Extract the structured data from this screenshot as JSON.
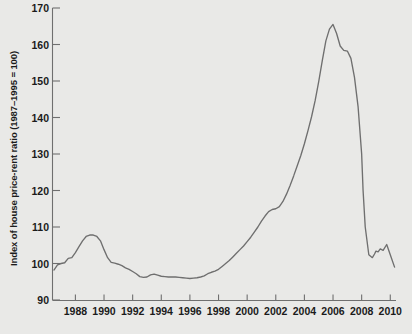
{
  "chart_data": {
    "type": "line",
    "title": "",
    "subtitle": "",
    "xlabel": "",
    "ylabel": "Index of house price-rent ratio (1987–1995 = 100)",
    "xlim": [
      1986.4,
      2010.4
    ],
    "ylim": [
      90,
      170
    ],
    "grid": false,
    "legend": null,
    "annotations": [],
    "xticks": [
      1988,
      1990,
      1992,
      1994,
      1996,
      1998,
      2000,
      2002,
      2004,
      2006,
      2008,
      2010
    ],
    "xtick_labels": [
      "1988",
      "1990",
      "1992",
      "1994",
      "1996",
      "1998",
      "2000",
      "2002",
      "2004",
      "2006",
      "2008",
      "2010"
    ],
    "yticks": [
      90,
      100,
      110,
      120,
      130,
      140,
      150,
      160,
      170
    ],
    "ytick_labels": [
      "90",
      "100",
      "110",
      "120",
      "130",
      "140",
      "150",
      "160",
      "170"
    ],
    "series": [
      {
        "name": "House price-rent ratio index",
        "color": "#6f6f6f",
        "x": [
          1986.5,
          1986.75,
          1987.0,
          1987.25,
          1987.5,
          1987.75,
          1988.0,
          1988.25,
          1988.5,
          1988.75,
          1989.0,
          1989.25,
          1989.5,
          1989.75,
          1990.0,
          1990.25,
          1990.5,
          1990.75,
          1991.0,
          1991.25,
          1991.5,
          1991.75,
          1992.0,
          1992.25,
          1992.5,
          1992.75,
          1993.0,
          1993.25,
          1993.5,
          1993.75,
          1994.0,
          1994.25,
          1994.5,
          1994.75,
          1995.0,
          1995.25,
          1995.5,
          1995.75,
          1996.0,
          1996.25,
          1996.5,
          1996.75,
          1997.0,
          1997.25,
          1997.5,
          1997.75,
          1998.0,
          1998.25,
          1998.5,
          1998.75,
          1999.0,
          1999.25,
          1999.5,
          1999.75,
          2000.0,
          2000.25,
          2000.5,
          2000.75,
          2001.0,
          2001.25,
          2001.5,
          2001.75,
          2002.0,
          2002.25,
          2002.5,
          2002.75,
          2003.0,
          2003.25,
          2003.5,
          2003.75,
          2004.0,
          2004.25,
          2004.5,
          2004.75,
          2005.0,
          2005.25,
          2005.5,
          2005.75,
          2006.0,
          2006.25,
          2006.5,
          2006.75,
          2007.0,
          2007.25,
          2007.5,
          2007.75,
          2008.0,
          2008.1,
          2008.25,
          2008.5,
          2008.75,
          2008.9,
          2009.0,
          2009.15,
          2009.3,
          2009.5,
          2009.75,
          2010.0,
          2010.3
        ],
        "values": [
          98.2,
          99.6,
          100.0,
          100.2,
          101.4,
          101.6,
          103.0,
          104.6,
          106.2,
          107.4,
          107.8,
          107.8,
          107.4,
          106.2,
          103.8,
          101.6,
          100.3,
          100.1,
          99.8,
          99.4,
          98.8,
          98.4,
          97.8,
          97.2,
          96.4,
          96.2,
          96.3,
          96.9,
          97.1,
          96.8,
          96.5,
          96.4,
          96.3,
          96.3,
          96.3,
          96.2,
          96.1,
          96.0,
          95.9,
          96.0,
          96.1,
          96.3,
          96.6,
          97.2,
          97.6,
          97.9,
          98.4,
          99.2,
          100.0,
          100.8,
          101.8,
          102.8,
          103.8,
          104.8,
          106.0,
          107.2,
          108.6,
          110.0,
          111.6,
          113.0,
          114.2,
          114.8,
          115.0,
          115.6,
          117.0,
          119.0,
          121.4,
          124.0,
          126.8,
          129.6,
          132.8,
          136.4,
          140.2,
          144.6,
          149.8,
          155.6,
          161.0,
          164.2,
          165.5,
          163.0,
          159.6,
          158.4,
          158.2,
          156.2,
          151.0,
          143.0,
          130.0,
          120.0,
          110.0,
          102.4,
          101.6,
          102.6,
          103.4,
          103.2,
          104.0,
          103.6,
          105.2,
          102.4,
          99.0
        ]
      }
    ]
  },
  "axes": {
    "axis_color": "#6f6f6f",
    "background": "#e9e9e7",
    "text_color": "#1b1b1b"
  }
}
